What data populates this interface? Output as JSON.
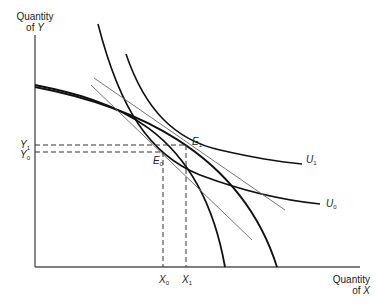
{
  "axes": {
    "y_label_line1": "Quantity",
    "y_label_line2": "of",
    "y_var": "Y",
    "x_label_line1": "Quantity",
    "x_label_line2": "of",
    "x_var": "X"
  },
  "points": {
    "E1": {
      "letter": "E",
      "sub": "1"
    },
    "E0": {
      "letter": "E",
      "sub": "0"
    }
  },
  "ticks": {
    "Y1": {
      "letter": "Y",
      "sub": "1"
    },
    "Y0": {
      "letter": "Y",
      "sub": "0"
    },
    "X0": {
      "letter": "X",
      "sub": "0"
    },
    "X1": {
      "letter": "X",
      "sub": "1"
    }
  },
  "curves": {
    "U1": {
      "letter": "U",
      "sub": "1"
    },
    "U0": {
      "letter": "U",
      "sub": "0"
    }
  },
  "colors": {
    "line": "#111111",
    "axis": "#555555",
    "tangent": "#666666"
  }
}
